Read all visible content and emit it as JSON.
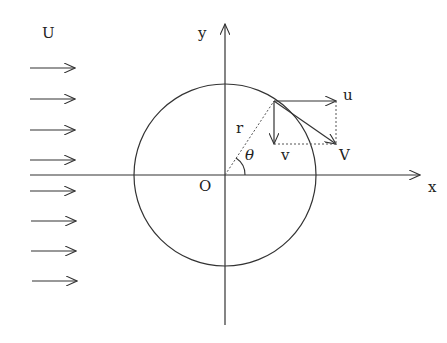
{
  "diagram": {
    "labels": {
      "freestream": "U",
      "y_axis": "y",
      "x_axis": "x",
      "origin": "O",
      "radius": "r",
      "angle": "θ",
      "u_component": "u",
      "v_component": "v",
      "velocity": "V"
    },
    "colors": {
      "line": "#333333",
      "background": "#ffffff"
    },
    "geometry": {
      "origin": [
        225,
        175
      ],
      "circle_radius": 91,
      "point_on_circle": [
        274,
        101
      ],
      "u_tip": [
        336,
        101
      ],
      "v_tip": [
        274,
        144
      ],
      "V_tip": [
        336,
        144
      ],
      "freestream_arrow_y": [
        68,
        99,
        130,
        160,
        191,
        221,
        251,
        281
      ]
    }
  }
}
